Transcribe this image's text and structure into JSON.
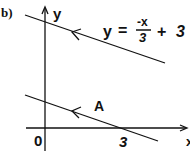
{
  "figure": {
    "part_label": "b)",
    "y_axis_label": "y",
    "x_axis_label": "x",
    "origin_label": "0",
    "x_intercept_label": "3",
    "point_label": "A",
    "equation": {
      "lhs": "y",
      "equals": "=",
      "numerator": "-x",
      "denominator": "3",
      "plus": "+",
      "constant": "3"
    },
    "colors": {
      "stroke": "#111111",
      "background": "#ffffff"
    }
  }
}
